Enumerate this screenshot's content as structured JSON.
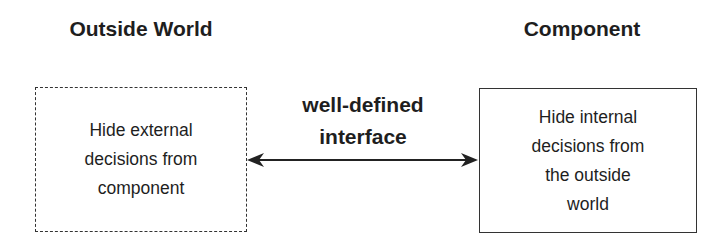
{
  "diagram": {
    "left": {
      "title": "Outside World",
      "box_style": "dashed",
      "lines": [
        "Hide external",
        "decisions from",
        "component"
      ]
    },
    "right": {
      "title": "Component",
      "box_style": "solid",
      "lines": [
        "Hide internal",
        "decisions from",
        "the outside",
        "world"
      ]
    },
    "connector": {
      "type": "bidirectional-arrow",
      "label_lines": [
        "well-defined",
        "interface"
      ]
    },
    "colors": {
      "ink": "#1e1e1e",
      "stroke": "#333333",
      "background": "#ffffff"
    }
  }
}
